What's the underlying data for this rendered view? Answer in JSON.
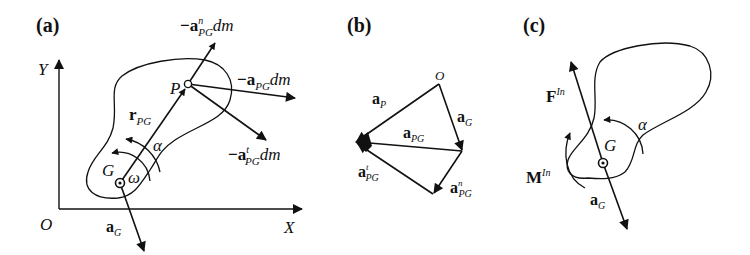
{
  "figure": {
    "panels": [
      {
        "id": "a",
        "label": "(a)",
        "axes": {
          "origin": "O",
          "x": "X",
          "y": "Y"
        },
        "points": {
          "G": "G",
          "P": "P"
        },
        "vectors": {
          "r_PG": {
            "base": "r",
            "sub": "PG"
          },
          "minus_a_n_PG_dm": {
            "prefix": "−",
            "base": "a",
            "sup": "n",
            "sub": "PG",
            "suffix": "dm"
          },
          "minus_a_PG_dm": {
            "prefix": "−",
            "base": "a",
            "sub": "PG",
            "suffix": "dm"
          },
          "minus_a_t_PG_dm": {
            "prefix": "−",
            "base": "a",
            "sup": "t",
            "sub": "PG",
            "suffix": "dm"
          },
          "a_G": {
            "base": "a",
            "sub": "G"
          }
        },
        "angles": {
          "alpha": "α",
          "omega": "ω"
        }
      },
      {
        "id": "b",
        "label": "(b)",
        "origin": "O",
        "vectors": {
          "a_P": {
            "base": "a",
            "sub": "P"
          },
          "a_G": {
            "base": "a",
            "sub": "G"
          },
          "a_PG": {
            "base": "a",
            "sub": "PG"
          },
          "a_t_PG": {
            "base": "a",
            "sup": "t",
            "sub": "PG"
          },
          "a_n_PG": {
            "base": "a",
            "sup": "n",
            "sub": "PG"
          }
        }
      },
      {
        "id": "c",
        "label": "(c)",
        "points": {
          "G": "G"
        },
        "vectors": {
          "F_In": {
            "base": "F",
            "sup": "In"
          },
          "M_In": {
            "base": "M",
            "sup": "In"
          },
          "a_G": {
            "base": "a",
            "sub": "G"
          }
        },
        "angles": {
          "alpha": "α"
        }
      }
    ],
    "colors": {
      "ink": "#111111",
      "background": "#ffffff"
    }
  }
}
